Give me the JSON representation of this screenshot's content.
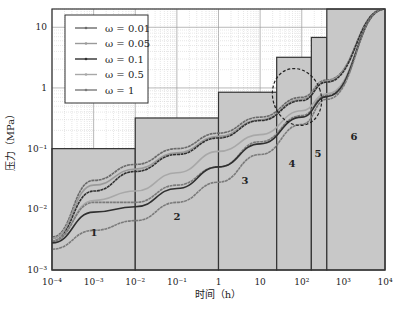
{
  "chart_data": {
    "type": "line",
    "title": "",
    "xlabel": "时间（h）",
    "ylabel": "压力（MPa）",
    "xscale": "log",
    "yscale": "log",
    "xlim": [
      0.0001,
      10000
    ],
    "ylim": [
      0.001,
      20
    ],
    "grid": true,
    "legend_position": "upper-left",
    "x_ticks": [
      "10^-4",
      "10^-3",
      "10^-2",
      "10^-1",
      "1",
      "10",
      "10^2",
      "10^3",
      "10^4"
    ],
    "x_tick_labels": [
      "10⁻⁴",
      "10⁻³",
      "10⁻²",
      "10⁻¹",
      "1",
      "10",
      "10²",
      "10³",
      "10⁴"
    ],
    "y_tick_labels": [
      "10⁻³",
      "10⁻²",
      "10⁻¹",
      "1",
      "10"
    ],
    "y_ticks": [
      0.001,
      0.01,
      0.1,
      1,
      10
    ],
    "regions": [
      {
        "label": "1",
        "x_start": 0.0001,
        "x_end": 0.01,
        "y_top": 0.1
      },
      {
        "label": "2",
        "x_start": 0.01,
        "x_end": 1,
        "y_top": 0.32
      },
      {
        "label": "3",
        "x_start": 1,
        "x_end": 25,
        "y_top": 0.85
      },
      {
        "label": "4",
        "x_start": 25,
        "x_end": 170,
        "y_top": 3.2
      },
      {
        "label": "5",
        "x_start": 170,
        "x_end": 400,
        "y_top": 6.8
      },
      {
        "label": "6",
        "x_start": 400,
        "x_end": 10000,
        "y_top": 20
      }
    ],
    "annotations": [
      {
        "type": "dashed-ellipse",
        "center_x": 80,
        "center_y": 0.4,
        "note": "curve convergence zone in regions 4-5"
      }
    ],
    "x": [
      0.0001,
      0.001,
      0.01,
      0.1,
      1,
      10,
      100,
      400,
      10000
    ],
    "series": [
      {
        "name": "ω = 0.01",
        "color": "#6a6a6a",
        "values": [
          0.0035,
          0.03,
          0.055,
          0.1,
          0.18,
          0.33,
          0.7,
          1.35,
          20
        ]
      },
      {
        "name": "ω = 0.05",
        "color": "#9a9a9a",
        "values": [
          0.0033,
          0.025,
          0.046,
          0.085,
          0.16,
          0.3,
          0.65,
          1.3,
          20
        ]
      },
      {
        "name": "ω = 0.1",
        "color": "#303030",
        "values": [
          0.003,
          0.02,
          0.042,
          0.08,
          0.15,
          0.29,
          0.62,
          1.25,
          20
        ]
      },
      {
        "name": "ω = 0.5",
        "color": "#a8a8a8",
        "values": [
          0.003,
          0.014,
          0.02,
          0.04,
          0.09,
          0.17,
          0.42,
          0.8,
          20
        ]
      },
      {
        "name": "ω = 1",
        "color": "#7a7a7a",
        "values": [
          0.003,
          0.013,
          0.013,
          0.025,
          0.05,
          0.13,
          0.35,
          0.75,
          20
        ]
      },
      {
        "name": "ω = 0.1 (lower)",
        "color": "#303030",
        "values": [
          0.0028,
          0.009,
          0.011,
          0.022,
          0.05,
          0.12,
          0.33,
          0.72,
          20
        ]
      },
      {
        "name": "ω = 0.01 (lower)",
        "color": "#7a7a7a",
        "values": [
          0.0022,
          0.0045,
          0.0065,
          0.013,
          0.028,
          0.08,
          0.25,
          0.65,
          20
        ]
      }
    ]
  },
  "legend": {
    "items": [
      {
        "label": "ω = 0.01",
        "color": "#6a6a6a"
      },
      {
        "label": "ω = 0.05",
        "color": "#9a9a9a"
      },
      {
        "label": "ω = 0.1",
        "color": "#303030"
      },
      {
        "label": "ω = 0.5",
        "color": "#a8a8a8"
      },
      {
        "label": "ω = 1",
        "color": "#7a7a7a"
      }
    ]
  },
  "axes": {
    "xlabel": "时间（h）",
    "ylabel": "压力（MPa）"
  },
  "colors": {
    "region_fill": "#c8c8c8",
    "region_border": "#333333",
    "grid_major": "#9a9a9a",
    "grid_minor": "#cfcfcf",
    "frame": "#333333"
  }
}
